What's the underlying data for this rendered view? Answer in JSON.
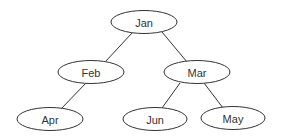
{
  "diagram": {
    "type": "tree",
    "colors": {
      "stroke": "#333333",
      "fill": "#ffffff",
      "text": "#333333"
    },
    "nodes": [
      {
        "id": "jan",
        "label": "Jan",
        "cx": 144,
        "cy": 22,
        "rx": 33,
        "ry": 11.5
      },
      {
        "id": "feb",
        "label": "Feb",
        "cx": 91,
        "cy": 72,
        "rx": 33,
        "ry": 11.5
      },
      {
        "id": "mar",
        "label": "Mar",
        "cx": 197,
        "cy": 72,
        "rx": 33,
        "ry": 11.5
      },
      {
        "id": "apr",
        "label": "Apr",
        "cx": 50,
        "cy": 119,
        "rx": 33,
        "ry": 11.5
      },
      {
        "id": "jun",
        "label": "Jun",
        "cx": 155,
        "cy": 119,
        "rx": 32,
        "ry": 11.5
      },
      {
        "id": "may",
        "label": "May",
        "cx": 233,
        "cy": 118,
        "rx": 32,
        "ry": 11.5
      }
    ],
    "edges": [
      {
        "from": "jan",
        "to": "feb",
        "x1": 132,
        "y1": 33,
        "x2": 106,
        "y2": 61
      },
      {
        "from": "jan",
        "to": "mar",
        "x1": 162,
        "y1": 32,
        "x2": 187,
        "y2": 62
      },
      {
        "from": "feb",
        "to": "apr",
        "x1": 86,
        "y1": 83,
        "x2": 61,
        "y2": 109
      },
      {
        "from": "mar",
        "to": "jun",
        "x1": 180,
        "y1": 83,
        "x2": 162,
        "y2": 108
      },
      {
        "from": "mar",
        "to": "may",
        "x1": 204,
        "y1": 83,
        "x2": 223,
        "y2": 108
      }
    ]
  }
}
